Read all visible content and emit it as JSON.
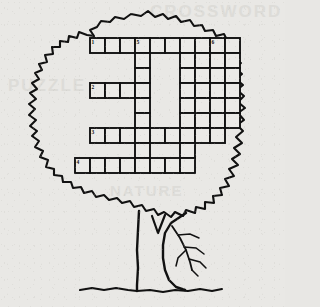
{
  "page": {
    "background_color": "#e9e8e5",
    "ink_color": "#111111",
    "cell_fill": "#ebeae7",
    "watermark_color": "#dddcd8"
  },
  "watermarks": [
    {
      "text": "CROSSWORD"
    },
    {
      "text": "PUZZLE"
    },
    {
      "text": "NATURE"
    }
  ],
  "artwork": {
    "name": "oak-tree-silhouette",
    "parts": [
      {
        "name": "foliage-canopy",
        "description": "jagged wavy leaf crown outline"
      },
      {
        "name": "trunk",
        "description": "two vertical wavy lines forming tree trunk"
      },
      {
        "name": "ground-line",
        "description": "wavy horizontal ground line"
      },
      {
        "name": "bare-branch",
        "description": "small branch with twigs at lower right"
      },
      {
        "name": "v-notch",
        "description": "small v shaped fork mark near trunk top"
      }
    ]
  },
  "crossword": {
    "name": "crossword-grid",
    "cell_size": 15,
    "origin_x": 75,
    "origin_y": 38,
    "columns": 11,
    "rows": 11,
    "stroke_width": 1.9,
    "number_font_size": 5.5,
    "cells": [
      {
        "c": 1,
        "r": 0,
        "n": "1"
      },
      {
        "c": 2,
        "r": 0
      },
      {
        "c": 3,
        "r": 0
      },
      {
        "c": 4,
        "r": 0,
        "n": "5"
      },
      {
        "c": 5,
        "r": 0
      },
      {
        "c": 6,
        "r": 0
      },
      {
        "c": 7,
        "r": 0
      },
      {
        "c": 8,
        "r": 0
      },
      {
        "c": 9,
        "r": 0,
        "n": "6"
      },
      {
        "c": 10,
        "r": 0
      },
      {
        "c": 4,
        "r": 1
      },
      {
        "c": 7,
        "r": 1
      },
      {
        "c": 8,
        "r": 1
      },
      {
        "c": 9,
        "r": 1
      },
      {
        "c": 10,
        "r": 1
      },
      {
        "c": 4,
        "r": 2
      },
      {
        "c": 7,
        "r": 2
      },
      {
        "c": 8,
        "r": 2
      },
      {
        "c": 9,
        "r": 2
      },
      {
        "c": 10,
        "r": 2
      },
      {
        "c": 1,
        "r": 3,
        "n": "2"
      },
      {
        "c": 2,
        "r": 3
      },
      {
        "c": 3,
        "r": 3
      },
      {
        "c": 4,
        "r": 3
      },
      {
        "c": 7,
        "r": 3
      },
      {
        "c": 8,
        "r": 3
      },
      {
        "c": 9,
        "r": 3
      },
      {
        "c": 10,
        "r": 3
      },
      {
        "c": 4,
        "r": 4
      },
      {
        "c": 7,
        "r": 4
      },
      {
        "c": 8,
        "r": 4
      },
      {
        "c": 9,
        "r": 4
      },
      {
        "c": 10,
        "r": 4
      },
      {
        "c": 4,
        "r": 5
      },
      {
        "c": 7,
        "r": 5
      },
      {
        "c": 8,
        "r": 5
      },
      {
        "c": 9,
        "r": 5
      },
      {
        "c": 10,
        "r": 5
      },
      {
        "c": 1,
        "r": 6,
        "n": "3"
      },
      {
        "c": 2,
        "r": 6
      },
      {
        "c": 3,
        "r": 6
      },
      {
        "c": 4,
        "r": 6
      },
      {
        "c": 5,
        "r": 6
      },
      {
        "c": 6,
        "r": 6
      },
      {
        "c": 7,
        "r": 6
      },
      {
        "c": 8,
        "r": 6
      },
      {
        "c": 9,
        "r": 6
      },
      {
        "c": 4,
        "r": 7
      },
      {
        "c": 7,
        "r": 7
      },
      {
        "c": 0,
        "r": 8,
        "n": "4"
      },
      {
        "c": 1,
        "r": 8
      },
      {
        "c": 2,
        "r": 8
      },
      {
        "c": 3,
        "r": 8
      },
      {
        "c": 4,
        "r": 8
      },
      {
        "c": 5,
        "r": 8
      },
      {
        "c": 6,
        "r": 8
      },
      {
        "c": 7,
        "r": 8
      }
    ],
    "numbers_visible": [
      "1",
      "2",
      "3",
      "4",
      "5",
      "6"
    ]
  }
}
